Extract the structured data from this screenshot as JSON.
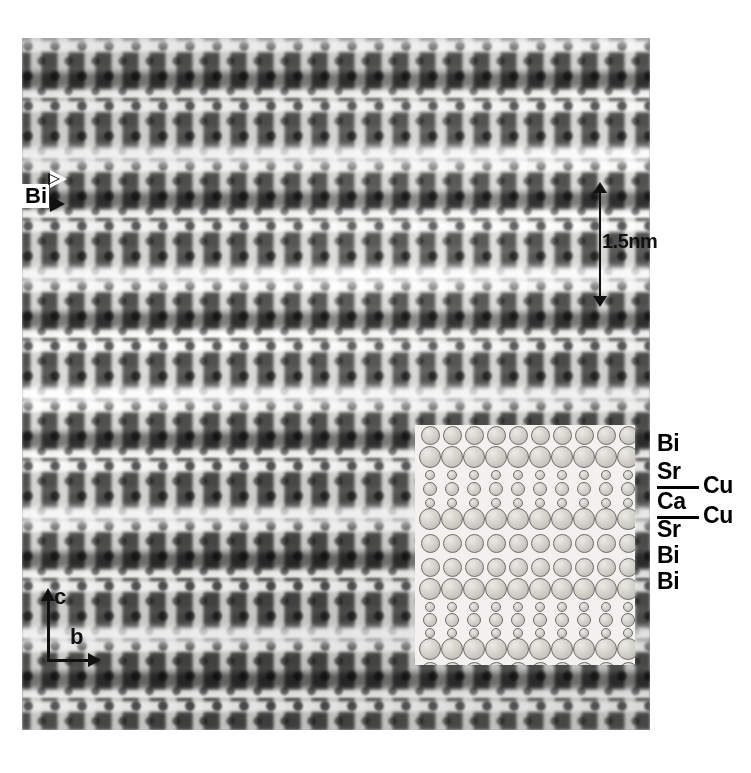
{
  "figure": {
    "type": "hrtem-lattice-image"
  },
  "markers": {
    "bi_marker_label": "Bi",
    "bi_marker_arrow_hollow": "triangle-right-outline-icon",
    "bi_marker_arrow_solid": "triangle-right-solid-icon"
  },
  "scalebar": {
    "label": "1.5nm",
    "arrow_top": "arrow-up-icon",
    "arrow_bottom": "arrow-down-icon",
    "length_nm": 1.5
  },
  "axes": {
    "vertical_label": "c",
    "horizontal_label": "b",
    "vertical_arrow": "arrow-up-icon",
    "horizontal_arrow": "arrow-right-icon"
  },
  "layer_labels": [
    {
      "text": "Bi",
      "top": 12,
      "left": 0,
      "rule": false
    },
    {
      "text": "Sr",
      "top": 40,
      "left": 0,
      "rule": false
    },
    {
      "text": "Cu",
      "top": 54,
      "left": 46,
      "rule": false
    },
    {
      "text": "Ca",
      "top": 70,
      "left": 0,
      "rule": false
    },
    {
      "text": "Cu",
      "top": 84,
      "left": 46,
      "rule": false
    },
    {
      "text": "Sr",
      "top": 98,
      "left": 0,
      "rule": false
    },
    {
      "text": "Bi",
      "top": 124,
      "left": 0,
      "rule": false
    },
    {
      "text": "Bi",
      "top": 150,
      "left": 0,
      "rule": false
    }
  ],
  "layer_rules": [
    {
      "top": 66
    },
    {
      "top": 96
    }
  ],
  "inset_model": {
    "columns": 10,
    "column_pitch": 22,
    "column_offset": 4,
    "rows": [
      {
        "name": "Bi",
        "y": 10,
        "r": 9.5,
        "kind": "large"
      },
      {
        "name": "Sr",
        "y": 32,
        "r": 11.0,
        "kind": "large"
      },
      {
        "name": "O",
        "y": 50,
        "r": 5.0,
        "kind": "small"
      },
      {
        "name": "Cu",
        "y": 64,
        "r": 7.0,
        "kind": "medium"
      },
      {
        "name": "O",
        "y": 78,
        "r": 5.0,
        "kind": "small"
      },
      {
        "name": "Ca",
        "y": 94,
        "r": 11.0,
        "kind": "large"
      },
      {
        "name": "Sr",
        "y": 118,
        "r": 9.5,
        "kind": "large"
      },
      {
        "name": "Bi",
        "y": 142,
        "r": 9.5,
        "kind": "large"
      },
      {
        "name": "Bi",
        "y": 164,
        "r": 11.0,
        "kind": "large"
      },
      {
        "name": "O",
        "y": 182,
        "r": 5.0,
        "kind": "small"
      },
      {
        "name": "Cu",
        "y": 195,
        "r": 7.0,
        "kind": "medium"
      },
      {
        "name": "O",
        "y": 208,
        "r": 5.0,
        "kind": "small"
      },
      {
        "name": "Sr",
        "y": 224,
        "r": 11.0,
        "kind": "large"
      },
      {
        "name": "Bi",
        "y": 246,
        "r": 9.5,
        "kind": "large"
      }
    ]
  },
  "colors": {
    "background": "#ffffff",
    "ink": "#111111",
    "inset_background": "#f2f1ee",
    "atom_outline": "#6d6d6d",
    "atom_fill": "#d2d0c9"
  }
}
